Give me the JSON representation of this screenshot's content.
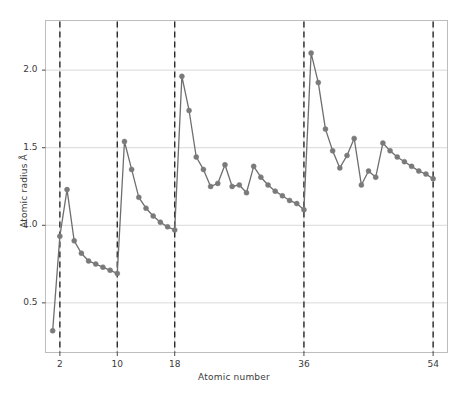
{
  "chart_data": {
    "type": "line",
    "title": "",
    "xlabel": "Atomic number",
    "ylabel": "Atomic radius Å",
    "xlim": [
      0,
      56
    ],
    "ylim": [
      0.18,
      2.32
    ],
    "grid": true,
    "legend": null,
    "marker": "circle",
    "line_color": "#6e6e6e",
    "marker_color": "#7a7a7a",
    "grid_color": "#d9d9d9",
    "vline_color": "#2b2b2b",
    "xticks": [
      2,
      10,
      18,
      36,
      54
    ],
    "xtick_labels": [
      "2",
      "10",
      "18",
      "36",
      "54"
    ],
    "yticks": [
      0.5,
      1.0,
      1.5,
      2.0
    ],
    "ytick_labels": [
      "0.5",
      "1.0",
      "1.5",
      "2.0"
    ],
    "vlines": [
      2,
      10,
      18,
      36,
      54
    ],
    "x": [
      1,
      2,
      3,
      4,
      5,
      6,
      7,
      8,
      9,
      10,
      11,
      12,
      13,
      14,
      15,
      16,
      17,
      18,
      19,
      20,
      21,
      22,
      23,
      24,
      25,
      26,
      27,
      28,
      29,
      30,
      31,
      32,
      33,
      34,
      35,
      36,
      37,
      38,
      39,
      40,
      41,
      42,
      43,
      44,
      45,
      46,
      47,
      48,
      49,
      50,
      51,
      52,
      53,
      54
    ],
    "values": [
      0.32,
      0.93,
      1.23,
      0.9,
      0.82,
      0.77,
      0.75,
      0.73,
      0.71,
      0.69,
      1.54,
      1.36,
      1.18,
      1.11,
      1.06,
      1.02,
      0.99,
      0.97,
      1.96,
      1.74,
      1.44,
      1.36,
      1.25,
      1.27,
      1.39,
      1.25,
      1.26,
      1.21,
      1.38,
      1.31,
      1.26,
      1.22,
      1.19,
      1.16,
      1.14,
      1.1,
      2.11,
      1.92,
      1.62,
      1.48,
      1.37,
      1.45,
      1.56,
      1.26,
      1.35,
      1.31,
      1.53,
      1.48,
      1.44,
      1.41,
      1.38,
      1.35,
      1.33,
      1.3
    ],
    "series_name": "Atomic radius"
  },
  "axis": {
    "xlabel": "Atomic number",
    "ylabel": "Atomic radius Å"
  }
}
